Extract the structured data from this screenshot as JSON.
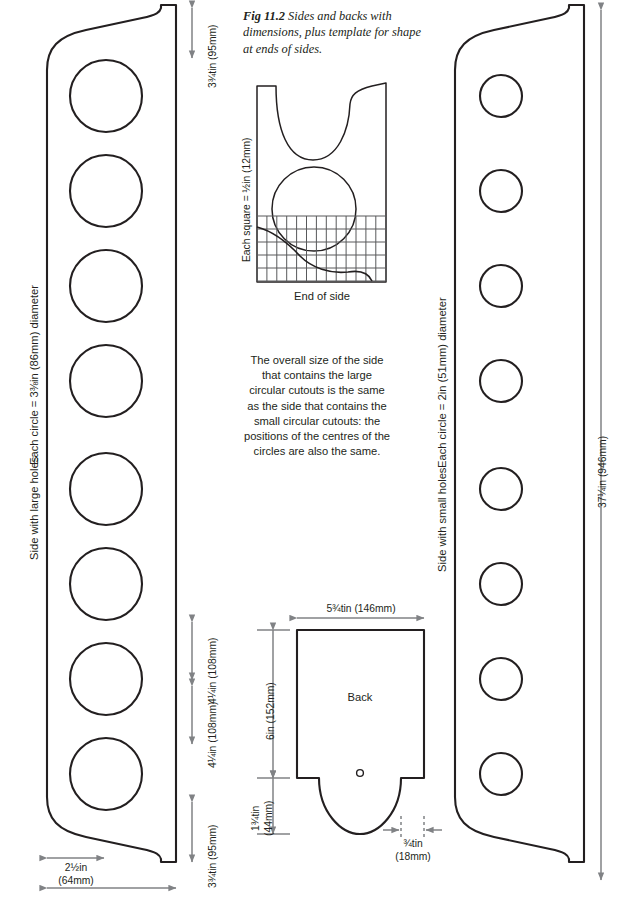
{
  "figure": {
    "caption_number": "Fig 11.2",
    "caption_text": "Sides and backs with dimensions, plus template for shape at ends of sides."
  },
  "left_panel": {
    "name_label": "Side with large holes",
    "circle_label": "Each circle = 3⅜in (86mm) diameter",
    "hole_count": 8,
    "dimensions": {
      "top_gap": "3¾tin (95mm)",
      "spacing_1": "4¼in (108mm)",
      "spacing_2": "4¼in (108mm)",
      "bottom_gap": "3¾tin (95mm)",
      "foot_width": "2½in\n(64mm)"
    }
  },
  "right_panel": {
    "name_label": "Side with small holes",
    "circle_label": "Each circle = 2in (51mm) diameter",
    "hole_count": 8,
    "dimensions": {
      "overall_height": "37¼in (946mm)"
    }
  },
  "template": {
    "square_label": "Each square = ½in (12mm)",
    "title": "End of side",
    "grid_columns": 13,
    "grid_rows": 5
  },
  "note": {
    "text": "The overall size of the side that contains the large circular cutouts is the same as the side that contains the small circular cutouts: the positions of the centres of the circles are also the same."
  },
  "back_panel": {
    "label": "Back",
    "dimensions": {
      "width": "5¾tin (146mm)",
      "body_height": "6in (152mm)",
      "curve_height": "1¾tin\n(44mm)",
      "shoulder": "¾tin\n(18mm)"
    }
  },
  "style": {
    "outline_color": "#231f20",
    "dimension_color": "#808285",
    "grid_color": "#58595b",
    "background": "#ffffff"
  }
}
